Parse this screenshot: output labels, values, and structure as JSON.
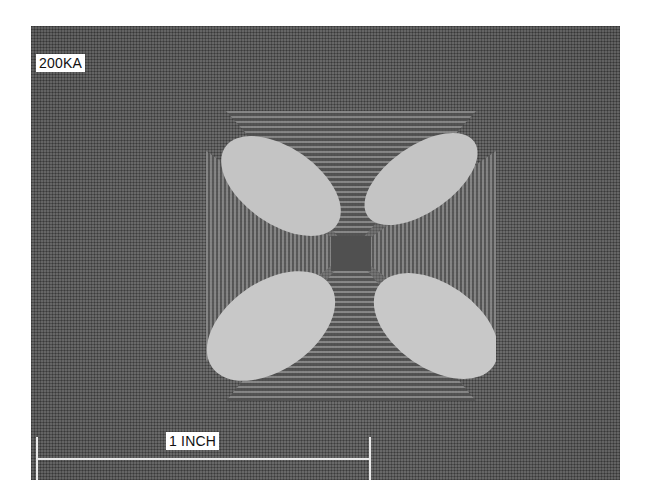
{
  "figure": {
    "current_label": "200KA",
    "scale_bar_label": "1 INCH",
    "colors": {
      "background": "#5a5a5a",
      "lobes": "#c8c8c8",
      "labels_bg": "#ffffff",
      "scale_bar": "#e8e8e8"
    }
  }
}
